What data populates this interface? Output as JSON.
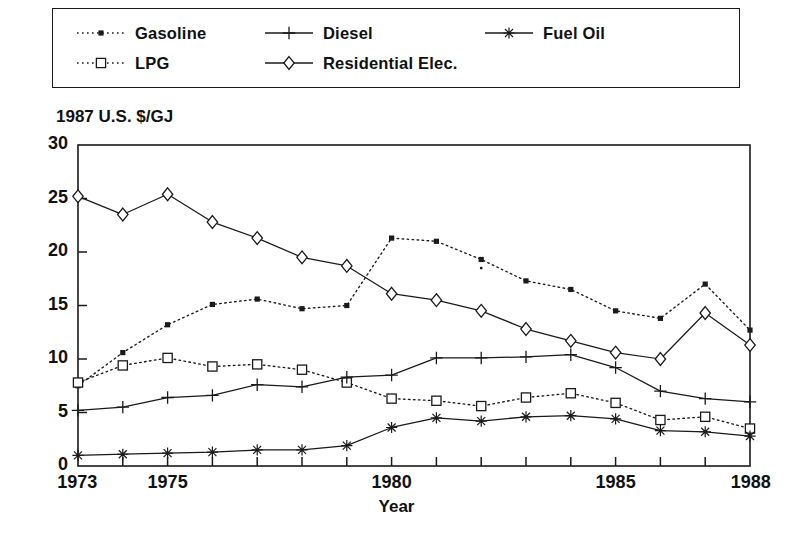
{
  "legend": {
    "entries": [
      {
        "label": "Gasoline",
        "marker": "filled-square-icon",
        "line": "dotted",
        "col": 0,
        "row": 0
      },
      {
        "label": "Diesel",
        "marker": "plus-icon",
        "line": "solid",
        "col": 1,
        "row": 0
      },
      {
        "label": "Fuel Oil",
        "marker": "asterisk-icon",
        "line": "solid",
        "col": 2,
        "row": 0
      },
      {
        "label": "LPG",
        "marker": "open-square-icon",
        "line": "dotted",
        "col": 0,
        "row": 1
      },
      {
        "label": "Residential Elec.",
        "marker": "open-diamond-icon",
        "line": "solid",
        "col": 1,
        "row": 1
      }
    ]
  },
  "chart_data": {
    "type": "line",
    "title": "",
    "xlabel": "Year",
    "ylabel": "1987 U.S. $/GJ",
    "xlim": [
      1973,
      1988
    ],
    "ylim": [
      0,
      30
    ],
    "xticks": [
      1973,
      1974,
      1975,
      1976,
      1977,
      1978,
      1979,
      1980,
      1981,
      1982,
      1983,
      1984,
      1985,
      1986,
      1987,
      1988
    ],
    "xtick_labels": [
      {
        "value": 1973,
        "label": "1973"
      },
      {
        "value": 1975,
        "label": "1975"
      },
      {
        "value": 1980,
        "label": "1980"
      },
      {
        "value": 1985,
        "label": "1985"
      },
      {
        "value": 1988,
        "label": "1988"
      }
    ],
    "yticks": [
      0,
      5,
      10,
      15,
      20,
      25,
      30
    ],
    "ytick_labels": [
      "0",
      "5",
      "10",
      "15",
      "20",
      "25",
      "30"
    ],
    "grid": false,
    "legend_position": "top",
    "x": [
      1973,
      1974,
      1975,
      1976,
      1977,
      1978,
      1979,
      1980,
      1981,
      1982,
      1983,
      1984,
      1985,
      1986,
      1987,
      1988
    ],
    "series": [
      {
        "name": "Gasoline",
        "marker": "filled-square-icon",
        "line": "dotted",
        "color": "#1a1a1a",
        "values": [
          7.5,
          10.6,
          13.2,
          15.1,
          15.6,
          14.7,
          15.0,
          21.3,
          21.0,
          19.3,
          17.3,
          16.5,
          14.5,
          13.8,
          17.0,
          12.7
        ]
      },
      {
        "name": "LPG",
        "marker": "open-square-icon",
        "line": "dotted",
        "color": "#1a1a1a",
        "values": [
          7.8,
          9.4,
          10.1,
          9.3,
          9.5,
          9.0,
          7.8,
          6.3,
          6.1,
          5.6,
          6.4,
          6.8,
          5.9,
          4.3,
          4.6,
          3.5
        ]
      },
      {
        "name": "Diesel",
        "marker": "plus-icon",
        "line": "solid",
        "color": "#1a1a1a",
        "values": [
          5.2,
          5.5,
          6.4,
          6.6,
          7.6,
          7.4,
          8.3,
          8.5,
          10.1,
          10.1,
          10.2,
          10.4,
          9.2,
          7.0,
          6.3,
          6.0
        ]
      },
      {
        "name": "Residential Elec.",
        "marker": "open-diamond-icon",
        "line": "solid",
        "color": "#1a1a1a",
        "values": [
          25.2,
          23.5,
          25.4,
          22.8,
          21.3,
          19.5,
          18.7,
          16.1,
          15.5,
          14.5,
          12.8,
          11.7,
          10.6,
          10.0,
          14.3,
          11.3
        ]
      },
      {
        "name": "Fuel Oil",
        "marker": "asterisk-icon",
        "line": "solid",
        "color": "#1a1a1a",
        "values": [
          1.0,
          1.1,
          1.2,
          1.3,
          1.5,
          1.5,
          1.9,
          3.6,
          4.5,
          4.2,
          4.6,
          4.7,
          4.4,
          3.3,
          3.2,
          2.8
        ]
      }
    ],
    "annotations": [
      {
        "x": 1982,
        "y": 18.5,
        "note": "stray-print-dot"
      }
    ]
  }
}
